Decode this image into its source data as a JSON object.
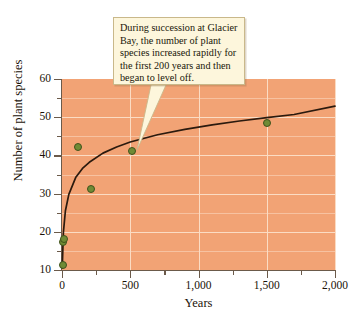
{
  "chart_data": {
    "type": "scatter",
    "title": "",
    "xlabel": "Years",
    "ylabel": "Number of plant species",
    "xlim": [
      0,
      2000
    ],
    "ylim": [
      10,
      60
    ],
    "x_ticks": [
      0,
      500,
      1000,
      1500,
      2000
    ],
    "x_tick_labels": [
      "0",
      "500",
      "1,000",
      "1,500",
      "2,000"
    ],
    "x_minor_ticks": [
      250,
      750,
      1250,
      1750
    ],
    "y_ticks": [
      10,
      20,
      30,
      40,
      50,
      60
    ],
    "y_tick_labels": [
      "10",
      "20",
      "30",
      "40",
      "50",
      "60"
    ],
    "y_minor_ticks": [
      15,
      25,
      35,
      45,
      55
    ],
    "grid": true,
    "legend": "none",
    "plot_background_color": "#f2a375",
    "gridline_color": "#fbdcc4",
    "point_color": "#6f8b35",
    "point_edge_color": "#40521c",
    "curve_color": "#2b1a0e",
    "points": [
      {
        "x": 5,
        "y": 11.2
      },
      {
        "x": 8,
        "y": 17.3
      },
      {
        "x": 15,
        "y": 18.2
      },
      {
        "x": 120,
        "y": 42.3
      },
      {
        "x": 215,
        "y": 31.3
      },
      {
        "x": 510,
        "y": 41.2
      },
      {
        "x": 1500,
        "y": 48.6
      }
    ],
    "fitted_curve": {
      "description": "logarithmic best-fit line rising steeply then leveling off",
      "x": [
        2,
        10,
        25,
        50,
        100,
        150,
        200,
        300,
        400,
        500,
        700,
        900,
        1100,
        1300,
        1500,
        1700,
        2000
      ],
      "y": [
        10.5,
        19.8,
        25.5,
        29.8,
        34.2,
        36.6,
        38.2,
        40.6,
        42.2,
        43.5,
        45.4,
        46.8,
        48.0,
        49.0,
        49.9,
        50.7,
        52.9
      ]
    },
    "annotations": [
      {
        "name": "succession-callout",
        "text": "During succession at Glacier Bay, the number of plant species increased rapidly for the first 200 years and then began to level off.",
        "lines": [
          "During succession at Glacier",
          "Bay, the number of plant",
          "species increased rapidly for",
          "the first 200 years and then",
          "began to level off."
        ],
        "points_to": {
          "x": 380,
          "y": 41.5
        },
        "box_color": "#fdf6dc",
        "box_border_color": "#c9b88a"
      }
    ]
  }
}
